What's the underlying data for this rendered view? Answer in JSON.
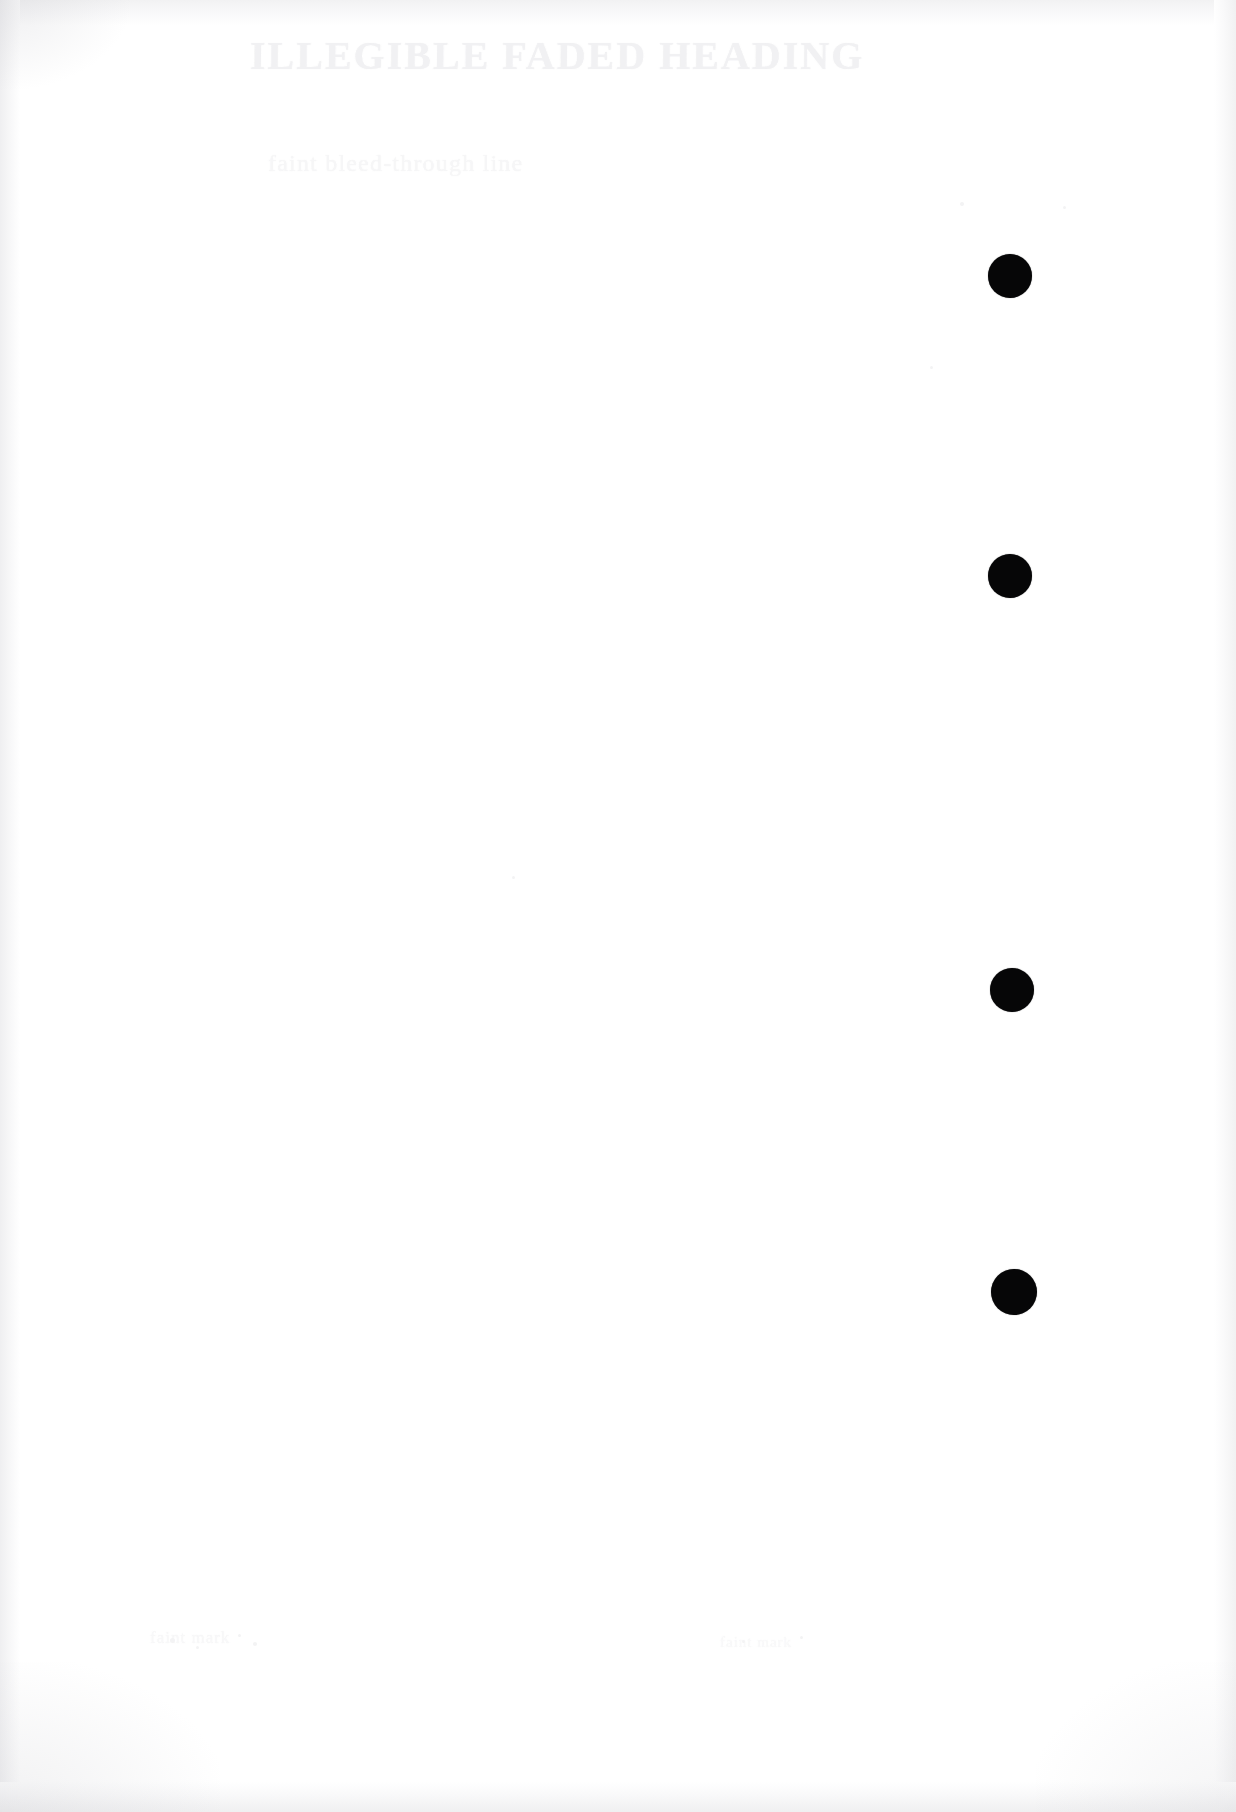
{
  "page": {
    "width": 1236,
    "height": 1812,
    "background_color": "#ffffff",
    "paper_tone": "#fdfdfd"
  },
  "ghost_text": {
    "title": "ILLEGIBLE FADED HEADING",
    "subtitle": "faint bleed-through line",
    "footer_left": "faint mark",
    "footer_right": "faint mark"
  },
  "margin_dots": {
    "color": "#060607",
    "count": 4,
    "items": [
      {
        "label": "register-dot-1",
        "cx": 1010,
        "cy": 276,
        "d": 44
      },
      {
        "label": "register-dot-2",
        "cx": 1010,
        "cy": 576,
        "d": 44
      },
      {
        "label": "register-dot-3",
        "cx": 1012,
        "cy": 990,
        "d": 44
      },
      {
        "label": "register-dot-4",
        "cx": 1014,
        "cy": 1292,
        "d": 46
      }
    ]
  },
  "specks": [
    {
      "x": 170,
      "y": 1638,
      "d": 5
    },
    {
      "x": 196,
      "y": 1646,
      "d": 3
    },
    {
      "x": 238,
      "y": 1634,
      "d": 3
    },
    {
      "x": 253,
      "y": 1642,
      "d": 4
    },
    {
      "x": 742,
      "y": 1640,
      "d": 3
    },
    {
      "x": 800,
      "y": 1636,
      "d": 3
    },
    {
      "x": 512,
      "y": 876,
      "d": 3
    },
    {
      "x": 960,
      "y": 202,
      "d": 4
    },
    {
      "x": 1063,
      "y": 206,
      "d": 3
    },
    {
      "x": 930,
      "y": 366,
      "d": 3
    }
  ]
}
